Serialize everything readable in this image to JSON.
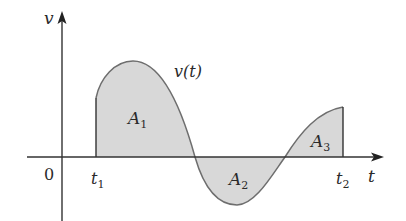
{
  "diagram": {
    "colors": {
      "fill": "#d8d8d8",
      "curve": "#6e6e6e",
      "axis": "#333333",
      "text": "#2a2a2a"
    },
    "axes": {
      "y_label": "v",
      "x_label": "t",
      "origin_label": "0"
    },
    "markers": {
      "t1": {
        "label": "t",
        "sub": "1"
      },
      "t2": {
        "label": "t",
        "sub": "2"
      }
    },
    "curve_label": "v(t)",
    "areas": [
      {
        "label": "A",
        "sub": "1",
        "sign": "positive"
      },
      {
        "label": "A",
        "sub": "2",
        "sign": "negative"
      },
      {
        "label": "A",
        "sub": "3",
        "sign": "positive"
      }
    ]
  }
}
